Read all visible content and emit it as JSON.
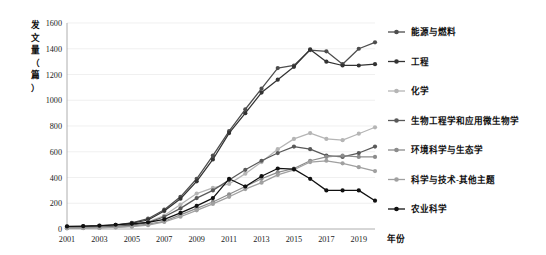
{
  "chart_data": {
    "type": "line",
    "title": "",
    "xlabel": "年份",
    "ylabel": "发文量（篇）",
    "ylabel_chars": [
      "发",
      "文",
      "量",
      "（",
      "篇",
      "）"
    ],
    "x": [
      2001,
      2002,
      2003,
      2004,
      2005,
      2006,
      2007,
      2008,
      2009,
      2010,
      2011,
      2012,
      2013,
      2014,
      2015,
      2016,
      2017,
      2018,
      2019,
      2020
    ],
    "xticks": [
      2001,
      2003,
      2005,
      2007,
      2009,
      2011,
      2013,
      2015,
      2017,
      2019
    ],
    "xlim": [
      2001,
      2020
    ],
    "ylim": [
      0,
      1600
    ],
    "yticks": [
      0,
      200,
      400,
      600,
      800,
      1000,
      1200,
      1400,
      1600
    ],
    "grid": true,
    "legend_position": "right",
    "series": [
      {
        "name": "能源与燃料",
        "color": "#4d4d4d",
        "values": [
          18,
          20,
          25,
          32,
          48,
          80,
          150,
          250,
          390,
          570,
          760,
          930,
          1090,
          1250,
          1270,
          1390,
          1380,
          1280,
          1400,
          1450
        ]
      },
      {
        "name": "工程",
        "color": "#333333",
        "values": [
          15,
          18,
          22,
          30,
          45,
          70,
          140,
          235,
          370,
          540,
          745,
          900,
          1060,
          1160,
          1260,
          1395,
          1300,
          1270,
          1270,
          1280
        ]
      },
      {
        "name": "化学",
        "color": "#b5b5b5",
        "values": [
          10,
          12,
          15,
          22,
          35,
          55,
          105,
          190,
          275,
          320,
          350,
          430,
          520,
          620,
          700,
          745,
          700,
          690,
          740,
          790
        ]
      },
      {
        "name": "生物工程学和应用微生物学",
        "color": "#595959",
        "values": [
          8,
          10,
          14,
          20,
          30,
          50,
          95,
          160,
          240,
          300,
          380,
          460,
          530,
          590,
          640,
          620,
          570,
          560,
          590,
          640
        ]
      },
      {
        "name": "环境科学与生态学",
        "color": "#8c8c8c",
        "values": [
          6,
          8,
          10,
          14,
          22,
          38,
          60,
          110,
          160,
          210,
          270,
          330,
          390,
          440,
          470,
          530,
          560,
          570,
          560,
          560
        ]
      },
      {
        "name": "科学与技术-其他主题",
        "color": "#a0a0a0",
        "values": [
          5,
          6,
          8,
          12,
          18,
          30,
          55,
          95,
          145,
          195,
          250,
          310,
          360,
          420,
          460,
          520,
          530,
          510,
          480,
          450
        ]
      },
      {
        "name": "农业科学",
        "color": "#111111",
        "values": [
          20,
          22,
          26,
          33,
          40,
          52,
          75,
          125,
          180,
          240,
          390,
          330,
          410,
          470,
          465,
          390,
          300,
          300,
          300,
          220
        ]
      }
    ]
  }
}
